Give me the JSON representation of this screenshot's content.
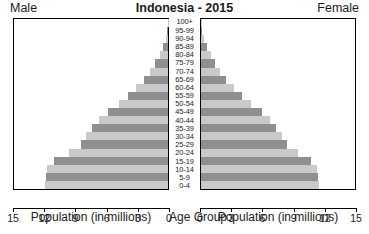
{
  "header": {
    "male_label": "Male",
    "title": "Indonesia - 2015",
    "female_label": "Female"
  },
  "footer": {
    "left_axis_title": "Population (in millions)",
    "center_axis_title": "Age Group",
    "right_axis_title": "Population (in millions)"
  },
  "colors": {
    "bar_dark": "#8f8f8f",
    "bar_light": "#c9c9c9",
    "axis": "#000000",
    "text": "#1a1a1a",
    "background": "#ffffff"
  },
  "axis": {
    "left_ticks": [
      "15",
      "12",
      "9",
      "6",
      "3",
      "0"
    ],
    "right_ticks": [
      "0",
      "3",
      "6",
      "9",
      "12",
      "15"
    ],
    "max": 15,
    "step": 3
  },
  "chart_data": {
    "type": "bar",
    "subtype": "population-pyramid",
    "title": "Indonesia - 2015",
    "xlabel": "Population (in millions)",
    "ylabel": "Age Group",
    "xlim": [
      0,
      15
    ],
    "grid": false,
    "legend": [
      "Male",
      "Female"
    ],
    "legend_position": "top-left-and-top-right",
    "orientation": "horizontal-mirrored",
    "categories": [
      "100+",
      "95-99",
      "90-94",
      "85-89",
      "80-84",
      "75-79",
      "70-74",
      "65-69",
      "60-64",
      "55-59",
      "50-54",
      "45-49",
      "40-44",
      "35-39",
      "30-34",
      "25-29",
      "20-24",
      "15-19",
      "10-14",
      "5-9",
      "0-4"
    ],
    "series": [
      {
        "name": "Male",
        "side": "left",
        "values": [
          0.02,
          0.09,
          0.22,
          0.45,
          0.82,
          1.25,
          1.75,
          2.3,
          3.1,
          3.9,
          4.8,
          5.8,
          6.7,
          7.4,
          8.0,
          8.5,
          9.6,
          11.1,
          11.8,
          11.9,
          12.0
        ]
      },
      {
        "name": "Female",
        "side": "right",
        "values": [
          0.04,
          0.14,
          0.32,
          0.58,
          0.95,
          1.35,
          1.85,
          2.4,
          3.2,
          4.0,
          4.9,
          5.9,
          6.7,
          7.3,
          7.9,
          8.4,
          9.4,
          10.7,
          11.3,
          11.4,
          11.5
        ]
      }
    ]
  }
}
